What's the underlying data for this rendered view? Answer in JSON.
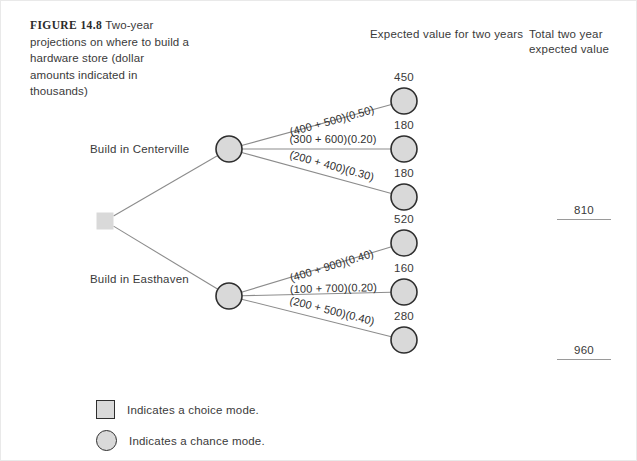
{
  "figure": {
    "number_label": "FIGURE 14.8",
    "caption": "Two-year projections on where to build a hardware store (dollar amounts indicated in thousands)"
  },
  "headers": {
    "expected_value": "Expected value for two years",
    "total_value": "Total two year expected value"
  },
  "root": {
    "type": "choice-node",
    "x": 104,
    "y": 220
  },
  "branches": [
    {
      "label": "Build in Centerville",
      "node": {
        "type": "chance-node",
        "x": 228,
        "y": 148
      },
      "total": "810",
      "outcomes": [
        {
          "label": "(400 + 500)(0.50)",
          "value": "450",
          "x": 403,
          "y": 100
        },
        {
          "label": "(300 + 600)(0.20)",
          "value": "180",
          "x": 403,
          "y": 148
        },
        {
          "label": "(200 + 400)(0.30)",
          "value": "180",
          "x": 403,
          "y": 196
        }
      ]
    },
    {
      "label": "Build in Easthaven",
      "node": {
        "type": "chance-node",
        "x": 228,
        "y": 295
      },
      "total": "960",
      "outcomes": [
        {
          "label": "(400 + 900)(0.40)",
          "value": "520",
          "x": 403,
          "y": 242
        },
        {
          "label": "(100 + 700)(0.20)",
          "value": "160",
          "x": 403,
          "y": 291
        },
        {
          "label": "(200 + 500)(0.40)",
          "value": "280",
          "x": 403,
          "y": 339
        }
      ]
    }
  ],
  "legend": [
    {
      "icon": "square",
      "text": "Indicates a choice mode."
    },
    {
      "icon": "circle",
      "text": "Indicates a chance mode."
    }
  ],
  "colors": {
    "node_fill": "#d9d9d9",
    "node_stroke": "#2e2e2e",
    "line": "#8c8c8c",
    "text": "#3a3a3a",
    "frame": "#e9e9e9"
  },
  "chart_data": {
    "type": "tree",
    "title": "Two-year projections on where to build a hardware store",
    "nodes": [
      "decision",
      "Build in Centerville",
      "Build in Easthaven"
    ],
    "series": [
      {
        "name": "Build in Centerville",
        "categories": [
          "(400 + 500)(0.50)",
          "(300 + 600)(0.20)",
          "(200 + 400)(0.30)"
        ],
        "values": [
          450,
          180,
          180
        ],
        "total": 810
      },
      {
        "name": "Build in Easthaven",
        "categories": [
          "(400 + 900)(0.40)",
          "(100 + 700)(0.20)",
          "(200 + 500)(0.40)"
        ],
        "values": [
          520,
          160,
          280
        ],
        "total": 960
      }
    ]
  }
}
